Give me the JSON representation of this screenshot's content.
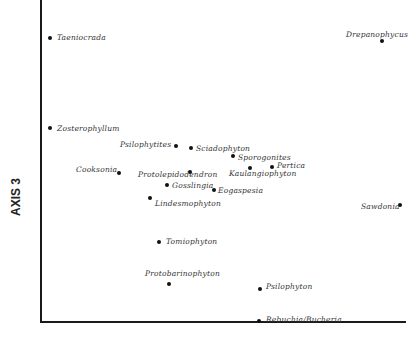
{
  "chart_data": {
    "type": "scatter",
    "title": "",
    "xlabel": "",
    "ylabel": "AXIS 3",
    "grid": false,
    "legend": null,
    "points": [
      {
        "name": "Taeniocrada",
        "px": [
          50,
          38
        ],
        "label_pos": [
          57,
          33
        ]
      },
      {
        "name": "Drepanophycus",
        "px": [
          382,
          41
        ],
        "label_pos": [
          346,
          30
        ]
      },
      {
        "name": "Zosterophyllum",
        "px": [
          50,
          128
        ],
        "label_pos": [
          57,
          124
        ]
      },
      {
        "name": "Psilophytites",
        "px": [
          176,
          146
        ],
        "label_pos": [
          120,
          140
        ]
      },
      {
        "name": "Sciadophyton",
        "px": [
          191,
          148
        ],
        "label_pos": [
          196,
          144
        ]
      },
      {
        "name": "Sporogonites",
        "px": [
          233,
          156
        ],
        "label_pos": [
          238,
          153
        ]
      },
      {
        "name": "Pertica",
        "px": [
          272,
          167
        ],
        "label_pos": [
          277,
          161
        ]
      },
      {
        "name": "Kaulangiophyton",
        "px": [
          250,
          168
        ],
        "label_pos": [
          229,
          169
        ]
      },
      {
        "name": "Cooksonia",
        "px": [
          119,
          173
        ],
        "label_pos": [
          76,
          165
        ]
      },
      {
        "name": "Protolepidodendron",
        "px": [
          190,
          172
        ],
        "label_pos": [
          138,
          170
        ]
      },
      {
        "name": "Gosslingia",
        "px": [
          167,
          185
        ],
        "label_pos": [
          172,
          181
        ]
      },
      {
        "name": "Eogaspesia",
        "px": [
          214,
          190
        ],
        "label_pos": [
          218,
          186
        ]
      },
      {
        "name": "Sawdonia",
        "px": [
          400,
          205
        ],
        "label_pos": [
          361,
          202
        ]
      },
      {
        "name": "Lindesmophyton",
        "px": [
          150,
          198
        ],
        "label_pos": [
          155,
          199
        ]
      },
      {
        "name": "Tomiophyton",
        "px": [
          159,
          242
        ],
        "label_pos": [
          166,
          237
        ]
      },
      {
        "name": "Protobarinophyton",
        "px": [
          169,
          284
        ],
        "label_pos": [
          145,
          269
        ]
      },
      {
        "name": "Psilophyton",
        "px": [
          260,
          289
        ],
        "label_pos": [
          266,
          282
        ]
      },
      {
        "name": "Rebuchia/Bucheria",
        "px": [
          259,
          321
        ],
        "label_pos": [
          266,
          315
        ]
      }
    ]
  }
}
